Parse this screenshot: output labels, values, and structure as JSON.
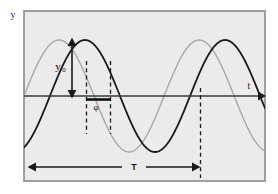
{
  "figure": {
    "kind": "sinusoid-phase-shift-diagram",
    "background_color": "#ffffff",
    "plot_background_color": "#ebebeb",
    "frame_color": "#8c8c8c"
  },
  "axes": {
    "y_axis_label": "y",
    "t_axis_label": "t",
    "axis_color": "#3a3a3a",
    "baseline_y": 96
  },
  "annotations": {
    "amplitude_label": "y",
    "amplitude_subscript": "0",
    "phase_label": "φ",
    "period_label": "T"
  },
  "chart_data": {
    "type": "line",
    "title": "",
    "xlabel": "t",
    "ylabel": "y",
    "grid": false,
    "legend_position": "none",
    "xlim": [
      0,
      1.72
    ],
    "ylim": [
      -1.12,
      1.12
    ],
    "annotations": [
      {
        "name": "amplitude",
        "label": "y₀",
        "kind": "double-arrow-vertical",
        "from": [
          0.33,
          0.0
        ],
        "to": [
          0.33,
          1.0
        ]
      },
      {
        "name": "phase",
        "label": "φ",
        "kind": "bracket-horizontal",
        "from": [
          0.44,
          -0.05
        ],
        "to": [
          0.62,
          -0.05
        ]
      },
      {
        "name": "period",
        "label": "T",
        "kind": "double-arrow-horizontal",
        "from": [
          0.0,
          -1.3
        ],
        "to": [
          1.0,
          -1.3
        ]
      },
      {
        "name": "marker-line-1",
        "kind": "dashed-vertical",
        "x": 0.44
      },
      {
        "name": "marker-line-2",
        "kind": "dashed-vertical",
        "x": 0.62
      },
      {
        "name": "marker-line-3",
        "kind": "dashed-vertical",
        "x": 1.0
      }
    ],
    "series": [
      {
        "name": "reference-wave",
        "color": "#a8a8a8",
        "line_width": 1.4,
        "phase_shift_fraction": 0.0,
        "amplitude": 1.0,
        "period": 1.0,
        "description": "Light gray sinusoid, leading reference wave"
      },
      {
        "name": "shifted-wave",
        "color": "#1a1a1a",
        "line_width": 1.8,
        "phase_shift_fraction": 0.185,
        "amplitude": 1.0,
        "period": 1.0,
        "description": "Black sinusoid, lagging by phase φ"
      }
    ]
  }
}
